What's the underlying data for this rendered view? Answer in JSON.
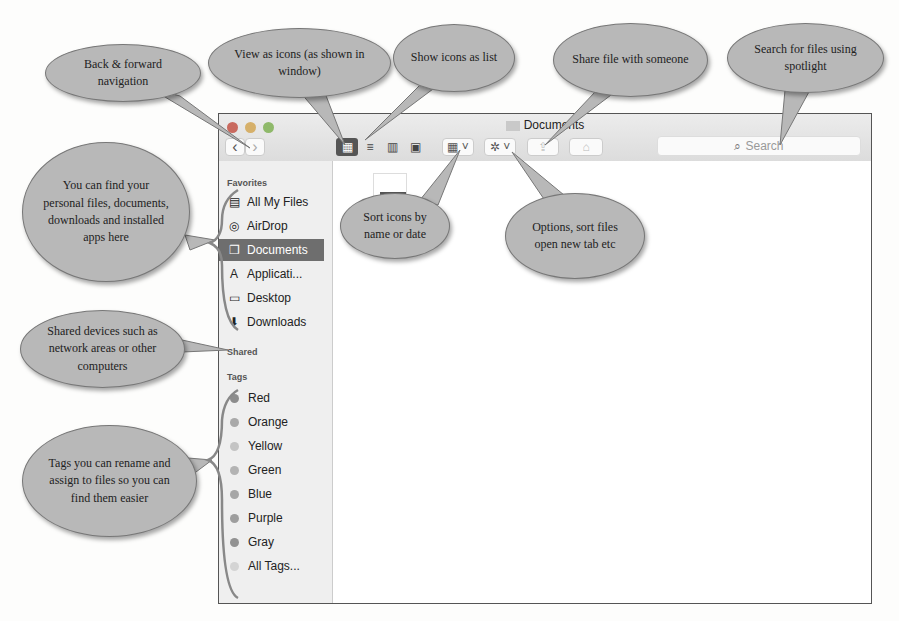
{
  "window": {
    "title": "Documents",
    "traffic_lights": [
      "#c96a5f",
      "#d6b06a",
      "#8fb96a"
    ]
  },
  "toolbar": {
    "back_glyph": "‹",
    "forward_glyph": "›",
    "view_icons_glyph": "▦",
    "view_list_glyph": "≡",
    "view_columns_glyph": "▥",
    "view_coverflow_glyph": "▣",
    "arrange_glyph": "▦ ˅",
    "action_glyph": "✲ ˅",
    "share_glyph": "⇪",
    "tag_glyph": "⌂",
    "search_icon": "⌕",
    "search_placeholder": "Search"
  },
  "sidebar": {
    "favorites_header": "Favorites",
    "favorites": [
      {
        "label": "All My Files",
        "icon": "▤"
      },
      {
        "label": "AirDrop",
        "icon": "◎"
      },
      {
        "label": "Documents",
        "icon": "❐",
        "selected": true
      },
      {
        "label": "Applicati...",
        "icon": "A"
      },
      {
        "label": "Desktop",
        "icon": "▭"
      },
      {
        "label": "Downloads",
        "icon": "⬇"
      }
    ],
    "shared_header": "Shared",
    "tags_header": "Tags",
    "tags": [
      {
        "label": "Red",
        "color": "#8c8c8c"
      },
      {
        "label": "Orange",
        "color": "#a9a9a9"
      },
      {
        "label": "Yellow",
        "color": "#c4c4c4"
      },
      {
        "label": "Green",
        "color": "#b3b3b3"
      },
      {
        "label": "Blue",
        "color": "#a6a6a6"
      },
      {
        "label": "Purple",
        "color": "#9e9e9e"
      },
      {
        "label": "Gray",
        "color": "#929292"
      },
      {
        "label": "All Tags...",
        "color": "#d4d4d4"
      }
    ]
  },
  "callouts": {
    "back_forward": "Back & forward navigation",
    "view_icons": "View as icons (as shown in window)",
    "show_list": "Show icons as list",
    "share": "Share file with someone",
    "search": "Search for files using spotlight",
    "favorites": "You can find your personal files, documents, downloads and installed apps here",
    "sort": "Sort icons by name or date",
    "options": "Options, sort files open new tab etc",
    "shared": "Shared devices such as network areas or other computers",
    "tags": "Tags you can rename and assign to files so you can find them easier"
  }
}
